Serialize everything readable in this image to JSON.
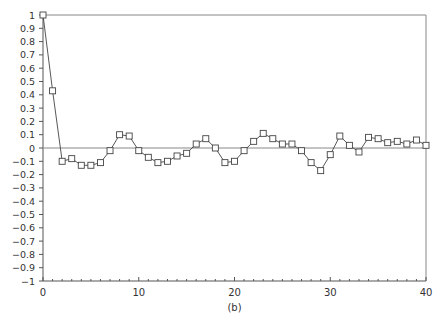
{
  "chart_data": {
    "type": "line",
    "title": "",
    "caption": "(b)",
    "xlabel": "",
    "ylabel": "",
    "xlim": [
      0,
      40
    ],
    "ylim": [
      -1,
      1
    ],
    "x_ticks": [
      0,
      10,
      20,
      30,
      40
    ],
    "y_ticks": [
      1,
      0.9,
      0.8,
      0.7,
      0.6,
      0.5,
      0.4,
      0.3,
      0.2,
      0.1,
      0,
      -0.1,
      -0.2,
      -0.3,
      -0.4,
      -0.5,
      -0.6,
      -0.7,
      -0.8,
      -0.9,
      -1
    ],
    "y_tick_labels": [
      "1",
      "0.9",
      "0.8",
      "0.7",
      "0.6",
      "0.5",
      "0.4",
      "0.3",
      "0.2",
      "0.1",
      "0",
      "-0.1",
      "-0.2",
      "-0.3",
      "-0.4",
      "-0.5",
      "-0.6",
      "-0.7",
      "-0.8",
      "-0.9",
      "-1"
    ],
    "grid": false,
    "zero_line": true,
    "marker": "square",
    "series": [
      {
        "name": "autocorrelation",
        "x": [
          0,
          1,
          2,
          3,
          4,
          5,
          6,
          7,
          8,
          9,
          10,
          11,
          12,
          13,
          14,
          15,
          16,
          17,
          18,
          19,
          20,
          21,
          22,
          23,
          24,
          25,
          26,
          27,
          28,
          29,
          30,
          31,
          32,
          33,
          34,
          35,
          36,
          37,
          38,
          39,
          40
        ],
        "values": [
          1.0,
          0.43,
          -0.1,
          -0.08,
          -0.13,
          -0.13,
          -0.11,
          -0.02,
          0.1,
          0.09,
          -0.02,
          -0.07,
          -0.11,
          -0.1,
          -0.06,
          -0.04,
          0.03,
          0.07,
          0.0,
          -0.11,
          -0.1,
          -0.02,
          0.05,
          0.11,
          0.07,
          0.03,
          0.03,
          -0.02,
          -0.11,
          -0.17,
          -0.05,
          0.09,
          0.02,
          -0.03,
          0.08,
          0.07,
          0.04,
          0.05,
          0.03,
          0.06,
          0.02
        ]
      }
    ]
  }
}
